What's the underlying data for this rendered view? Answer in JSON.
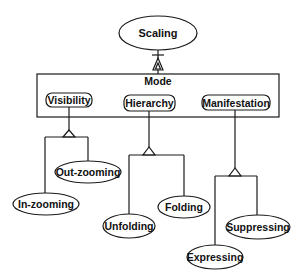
{
  "diagram": {
    "type": "OPM aggregation/specialization diagram",
    "root": {
      "label": "Scaling",
      "shape": "ellipse",
      "cx": 158,
      "cy": 33,
      "rx": 39,
      "ry": 17
    },
    "root_link": {
      "kind": "exhibition",
      "bar_y": 55,
      "triangle_top": 58,
      "triangle_bottom": 70
    },
    "mode_box": {
      "label": "Mode",
      "x": 37,
      "y": 74,
      "width": 242,
      "height": 43
    },
    "attributes": [
      {
        "id": "visibility",
        "label": "Visibility",
        "rect": {
          "x": 46,
          "y": 93,
          "width": 46,
          "height": 14
        },
        "stem_x": 69,
        "triangle": {
          "apex_y": 130,
          "base_y": 137,
          "half_width": 6
        },
        "bar": {
          "y": 137,
          "x1": 45,
          "x2": 88
        },
        "children": [
          {
            "label": "In-zooming",
            "branch_x": 45,
            "cx": 46,
            "cy": 204,
            "rx": 33,
            "ry": 11
          },
          {
            "label": "Out-zooming",
            "branch_x": 88,
            "cx": 88,
            "cy": 172,
            "rx": 33,
            "ry": 11
          }
        ]
      },
      {
        "id": "hierarchy",
        "label": "Hierarchy",
        "rect": {
          "x": 124,
          "y": 95,
          "width": 51,
          "height": 16
        },
        "stem_x": 149,
        "triangle": {
          "apex_y": 147,
          "base_y": 155,
          "half_width": 6
        },
        "bar": {
          "y": 155,
          "x1": 129,
          "x2": 184
        },
        "children": [
          {
            "label": "Unfolding",
            "branch_x": 129,
            "cx": 129,
            "cy": 226,
            "rx": 26,
            "ry": 12
          },
          {
            "label": "Folding",
            "branch_x": 184,
            "cx": 184,
            "cy": 207,
            "rx": 26,
            "ry": 11
          }
        ]
      },
      {
        "id": "manifestation",
        "label": "Manifestation",
        "rect": {
          "x": 202,
          "y": 95,
          "width": 68,
          "height": 15
        },
        "stem_x": 235,
        "triangle": {
          "apex_y": 168,
          "base_y": 176,
          "half_width": 6
        },
        "bar": {
          "y": 176,
          "x1": 215,
          "x2": 257
        },
        "children": [
          {
            "label": "Expressing",
            "branch_x": 215,
            "cx": 215,
            "cy": 257,
            "rx": 28,
            "ry": 12
          },
          {
            "label": "Suppressing",
            "branch_x": 257,
            "cx": 258,
            "cy": 227,
            "rx": 32,
            "ry": 12
          }
        ]
      }
    ],
    "colors": {
      "stroke": "#1a1a1a",
      "fill": "#ffffff",
      "text": "#111111",
      "background": "#ffffff"
    }
  }
}
